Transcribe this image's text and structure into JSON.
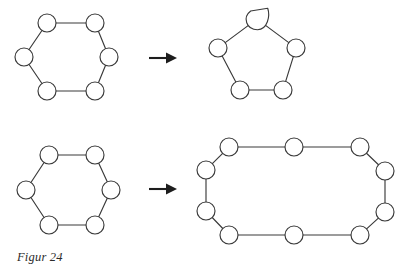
{
  "figure": {
    "caption": "Figur 24",
    "stroke_color": "#3a3a3a",
    "fill_color": "#ffffff",
    "background_color": "#ffffff",
    "stroke_width": 1.15,
    "node_radius": 9.0,
    "rows": [
      {
        "row_name": "row-1",
        "source": {
          "shape_name": "hexagon-ring-top",
          "node_count": 6,
          "nodes": [
            {
              "id": "h1-n1",
              "x": 47.0,
              "y": 23.0,
              "r": 9.0
            },
            {
              "id": "h1-n2",
              "x": 95.0,
              "y": 23.0,
              "r": 9.0
            },
            {
              "id": "h1-n3",
              "x": 109.0,
              "y": 57.0,
              "r": 9.0
            },
            {
              "id": "h1-n4",
              "x": 95.0,
              "y": 91.0,
              "r": 9.0
            },
            {
              "id": "h1-n5",
              "x": 47.0,
              "y": 91.0,
              "r": 9.0
            },
            {
              "id": "h1-n6",
              "x": 24.0,
              "y": 57.0,
              "r": 9.0
            }
          ],
          "edges": [
            [
              0,
              1
            ],
            [
              1,
              2
            ],
            [
              2,
              3
            ],
            [
              3,
              4
            ],
            [
              4,
              5
            ],
            [
              5,
              0
            ]
          ]
        },
        "arrow": {
          "name": "arrow-right-1",
          "x1": 149.0,
          "y1": 58.0,
          "x2": 177.0,
          "y2": 58.0,
          "head_length": 11.0,
          "head_width": 11.0
        },
        "target": {
          "shape_name": "pentagon-ring-with-merged-node",
          "node_count": 5,
          "nodes": [
            {
              "id": "p1-n1",
              "x": 257.0,
              "y": 19.0,
              "r": 9.0,
              "type": "teardrop",
              "note": "merged node drawn as a leaf/teardrop with a point at upper right"
            },
            {
              "id": "p1-n2",
              "x": 296.0,
              "y": 48.0,
              "r": 9.0,
              "type": "circle"
            },
            {
              "id": "p1-n3",
              "x": 283.0,
              "y": 90.0,
              "r": 9.0,
              "type": "circle"
            },
            {
              "id": "p1-n4",
              "x": 240.0,
              "y": 90.0,
              "r": 9.0,
              "type": "circle"
            },
            {
              "id": "p1-n5",
              "x": 218.0,
              "y": 48.0,
              "r": 9.0,
              "type": "circle"
            }
          ],
          "edges": [
            [
              0,
              1
            ],
            [
              1,
              2
            ],
            [
              2,
              3
            ],
            [
              3,
              4
            ],
            [
              4,
              0
            ]
          ]
        }
      },
      {
        "row_name": "row-2",
        "source": {
          "shape_name": "hexagon-ring-bottom",
          "node_count": 6,
          "nodes": [
            {
              "id": "h2-n1",
              "x": 49.0,
              "y": 155.0,
              "r": 9.0
            },
            {
              "id": "h2-n2",
              "x": 95.0,
              "y": 155.0,
              "r": 9.0
            },
            {
              "id": "h2-n3",
              "x": 111.0,
              "y": 190.0,
              "r": 9.0
            },
            {
              "id": "h2-n4",
              "x": 95.0,
              "y": 225.0,
              "r": 9.0
            },
            {
              "id": "h2-n5",
              "x": 49.0,
              "y": 225.0,
              "r": 9.0
            },
            {
              "id": "h2-n6",
              "x": 26.0,
              "y": 190.0,
              "r": 9.0
            }
          ],
          "edges": [
            [
              0,
              1
            ],
            [
              1,
              2
            ],
            [
              2,
              3
            ],
            [
              3,
              4
            ],
            [
              4,
              5
            ],
            [
              5,
              0
            ]
          ]
        },
        "arrow": {
          "name": "arrow-right-2",
          "x1": 149.0,
          "y1": 189.0,
          "x2": 177.0,
          "y2": 189.0,
          "head_length": 11.0,
          "head_width": 11.0
        },
        "target": {
          "shape_name": "dodecagon-elongated-ring",
          "node_count": 12,
          "nodes": [
            {
              "id": "d1-n1",
              "x": 229.0,
              "y": 147.0,
              "r": 9.0
            },
            {
              "id": "d1-n2",
              "x": 294.0,
              "y": 147.0,
              "r": 9.0
            },
            {
              "id": "d1-n3",
              "x": 360.0,
              "y": 147.0,
              "r": 9.0
            },
            {
              "id": "d1-n4",
              "x": 385.0,
              "y": 171.0,
              "r": 9.0
            },
            {
              "id": "d1-n5",
              "x": 385.0,
              "y": 212.0,
              "r": 9.0
            },
            {
              "id": "d1-n6",
              "x": 360.0,
              "y": 235.0,
              "r": 9.0
            },
            {
              "id": "d1-n7",
              "x": 294.0,
              "y": 235.0,
              "r": 9.0
            },
            {
              "id": "d1-n8",
              "x": 229.0,
              "y": 235.0,
              "r": 9.0
            },
            {
              "id": "d1-n9",
              "x": 206.0,
              "y": 211.0,
              "r": 9.0
            },
            {
              "id": "d1-n10",
              "x": 206.0,
              "y": 170.0,
              "r": 9.0
            },
            {
              "id": "d1-n11",
              "x": 206.0,
              "y": 170.0,
              "r": 0.0,
              "hidden": true
            },
            {
              "id": "d1-n12",
              "x": 206.0,
              "y": 170.0,
              "r": 0.0,
              "hidden": true
            }
          ],
          "edges": [
            [
              0,
              1
            ],
            [
              1,
              2
            ],
            [
              2,
              3
            ],
            [
              3,
              4
            ],
            [
              4,
              5
            ],
            [
              5,
              6
            ],
            [
              6,
              7
            ],
            [
              7,
              8
            ],
            [
              8,
              9
            ],
            [
              9,
              0
            ]
          ]
        }
      }
    ]
  }
}
